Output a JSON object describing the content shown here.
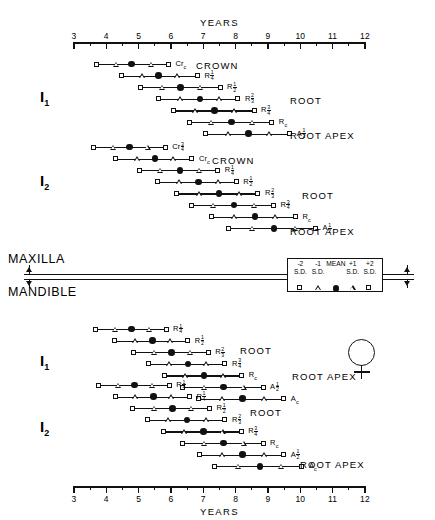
{
  "axis": {
    "title": "YEARS",
    "min": 3,
    "max": 12,
    "ticks": [
      3,
      4,
      5,
      6,
      7,
      8,
      9,
      10,
      11,
      12
    ],
    "tick_labels": [
      "3",
      "4",
      "5",
      "6",
      "7",
      "8",
      "9",
      "10",
      "11",
      "12"
    ],
    "minor_per_interval": 1
  },
  "jaw": {
    "upper": "MAXILLA",
    "lower": "MANDIBLE"
  },
  "sex_symbol": "female-symbol",
  "legend": {
    "labels": [
      {
        "top": "-2",
        "bottom": "S.D.",
        "x": 10.0,
        "symbol": "square"
      },
      {
        "top": "-1",
        "bottom": "S.D.",
        "x": 10.55,
        "symbol": "triangle"
      },
      {
        "top": "",
        "bottom": "MEAN",
        "x": 11.1,
        "symbol": "dot"
      },
      {
        "top": "+1",
        "bottom": "S.D.",
        "x": 11.62,
        "symbol": "triangle"
      },
      {
        "top": "+2",
        "bottom": "S.D.",
        "x": 12.15,
        "symbol": "square"
      }
    ]
  },
  "headings": {
    "crown": "CROWN",
    "root": "ROOT",
    "root_apex": "ROOT APEX"
  },
  "chart_data": {
    "type": "range-dot",
    "xlabel": "YEARS",
    "xlim": [
      3,
      12
    ],
    "grid": false,
    "legend_position": "center",
    "symbol_meaning": {
      "square": "±2 S.D.",
      "triangle": "±1 S.D.",
      "dot": "MEAN"
    },
    "sections": [
      {
        "jaw": "MAXILLA",
        "tooth": "I",
        "tooth_sub": "1",
        "rows": [
          {
            "stage": "Cr",
            "stage_sub": "c",
            "frac": null,
            "sd_minus2": 3.72,
            "sd_minus1": 4.32,
            "mean": 4.78,
            "sd_plus1": 5.38,
            "sd_plus2": 5.95
          },
          {
            "stage": "R",
            "frac": "1/4",
            "sd_minus2": 4.5,
            "sd_minus1": 5.1,
            "mean": 5.62,
            "sd_plus1": 6.2,
            "sd_plus2": 6.85
          },
          {
            "stage": "R",
            "frac": "1/2",
            "sd_minus2": 5.1,
            "sd_minus1": 5.72,
            "mean": 6.3,
            "sd_plus1": 6.9,
            "sd_plus2": 7.55
          },
          {
            "stage": "R",
            "frac": "2/3",
            "sd_minus2": 5.65,
            "sd_minus1": 6.28,
            "mean": 6.9,
            "sd_plus1": 7.5,
            "sd_plus2": 8.1
          },
          {
            "stage": "R",
            "frac": "3/4",
            "sd_minus2": 6.1,
            "sd_minus1": 6.75,
            "mean": 7.35,
            "sd_plus1": 7.95,
            "sd_plus2": 8.6
          },
          {
            "stage": "R",
            "stage_sub": "c",
            "frac": null,
            "sd_minus2": 6.6,
            "sd_minus1": 7.25,
            "mean": 7.88,
            "sd_plus1": 8.5,
            "sd_plus2": 9.15
          },
          {
            "stage": "A",
            "frac": "1/2",
            "sd_minus2": 7.1,
            "sd_minus1": 7.78,
            "mean": 8.4,
            "sd_plus1": 9.05,
            "sd_plus2": 9.7
          }
        ]
      },
      {
        "jaw": "MAXILLA",
        "tooth": "I",
        "tooth_sub": "2",
        "rows": [
          {
            "stage": "Cr",
            "frac": "3/4",
            "sd_minus2": 3.62,
            "sd_minus1": 4.2,
            "mean": 4.72,
            "sd_plus1": 5.28,
            "sd_plus2": 5.85
          },
          {
            "stage": "Cr",
            "stage_sub": "c",
            "frac": null,
            "sd_minus2": 4.32,
            "sd_minus1": 4.95,
            "mean": 5.5,
            "sd_plus1": 6.08,
            "sd_plus2": 6.68
          },
          {
            "stage": "R",
            "frac": "1/4",
            "sd_minus2": 5.05,
            "sd_minus1": 5.68,
            "mean": 6.28,
            "sd_plus1": 6.88,
            "sd_plus2": 7.48
          },
          {
            "stage": "R",
            "frac": "1/2",
            "sd_minus2": 5.6,
            "sd_minus1": 6.25,
            "mean": 6.85,
            "sd_plus1": 7.45,
            "sd_plus2": 8.05
          },
          {
            "stage": "R",
            "frac": "2/3",
            "sd_minus2": 6.2,
            "sd_minus1": 6.88,
            "mean": 7.48,
            "sd_plus1": 8.1,
            "sd_plus2": 8.72
          },
          {
            "stage": "R",
            "frac": "3/4",
            "sd_minus2": 6.65,
            "sd_minus1": 7.32,
            "mean": 7.95,
            "sd_plus1": 8.58,
            "sd_plus2": 9.2
          },
          {
            "stage": "R",
            "stage_sub": "c",
            "frac": null,
            "sd_minus2": 7.28,
            "sd_minus1": 7.95,
            "mean": 8.6,
            "sd_plus1": 9.22,
            "sd_plus2": 9.88
          },
          {
            "stage": "A",
            "frac": "1/2",
            "sd_minus2": 7.82,
            "sd_minus1": 8.52,
            "mean": 9.18,
            "sd_plus1": 9.85,
            "sd_plus2": 10.5
          }
        ]
      },
      {
        "jaw": "MANDIBLE",
        "tooth": "I",
        "tooth_sub": "1",
        "rows": [
          {
            "stage": "R",
            "frac": "1/4",
            "sd_minus2": 3.7,
            "sd_minus1": 4.28,
            "mean": 4.78,
            "sd_plus1": 5.32,
            "sd_plus2": 5.88
          },
          {
            "stage": "R",
            "frac": "1/2",
            "sd_minus2": 4.28,
            "sd_minus1": 4.88,
            "mean": 5.42,
            "sd_plus1": 5.98,
            "sd_plus2": 6.55
          },
          {
            "stage": "R",
            "frac": "2/3",
            "sd_minus2": 4.88,
            "sd_minus1": 5.48,
            "mean": 6.02,
            "sd_plus1": 6.6,
            "sd_plus2": 7.18
          },
          {
            "stage": "R",
            "frac": "3/4",
            "sd_minus2": 5.35,
            "sd_minus1": 5.95,
            "mean": 6.52,
            "sd_plus1": 7.1,
            "sd_plus2": 7.7
          },
          {
            "stage": "R",
            "stage_sub": "c",
            "frac": null,
            "sd_minus2": 5.82,
            "sd_minus1": 6.45,
            "mean": 7.02,
            "sd_plus1": 7.62,
            "sd_plus2": 8.22
          },
          {
            "stage": "A",
            "frac": "1/2",
            "sd_minus2": 6.4,
            "sd_minus1": 7.02,
            "mean": 7.62,
            "sd_plus1": 8.25,
            "sd_plus2": 8.88
          },
          {
            "stage": "A",
            "stage_sub": "c",
            "frac": null,
            "sd_minus2": 6.88,
            "sd_minus1": 7.58,
            "mean": 8.22,
            "sd_plus1": 8.88,
            "sd_plus2": 9.52
          }
        ]
      },
      {
        "jaw": "MANDIBLE",
        "tooth": "I",
        "tooth_sub": "2",
        "rows": [
          {
            "stage": "R",
            "frac": "1/4",
            "sd_minus2": 3.8,
            "sd_minus1": 4.38,
            "mean": 4.88,
            "sd_plus1": 5.42,
            "sd_plus2": 5.98
          },
          {
            "stage": "R",
            "frac": "1/4",
            "sd_minus2": 4.3,
            "sd_minus1": 4.9,
            "mean": 5.45,
            "sd_plus1": 6.02,
            "sd_plus2": 6.6
          },
          {
            "stage": "R",
            "frac": "1/2",
            "sd_minus2": 4.85,
            "sd_minus1": 5.48,
            "mean": 6.05,
            "sd_plus1": 6.62,
            "sd_plus2": 7.22
          },
          {
            "stage": "R",
            "frac": "2/3",
            "sd_minus2": 5.3,
            "sd_minus1": 5.92,
            "mean": 6.5,
            "sd_plus1": 7.1,
            "sd_plus2": 7.7
          },
          {
            "stage": "R",
            "frac": "3/4",
            "sd_minus2": 5.8,
            "sd_minus1": 6.42,
            "mean": 7.0,
            "sd_plus1": 7.6,
            "sd_plus2": 8.2
          },
          {
            "stage": "R",
            "stage_sub": "c",
            "frac": null,
            "sd_minus2": 6.38,
            "sd_minus1": 7.02,
            "mean": 7.62,
            "sd_plus1": 8.25,
            "sd_plus2": 8.88
          },
          {
            "stage": "A",
            "frac": "1/2",
            "sd_minus2": 6.9,
            "sd_minus1": 7.58,
            "mean": 8.22,
            "sd_plus1": 8.88,
            "sd_plus2": 9.52
          },
          {
            "stage": "A",
            "stage_sub": "c",
            "frac": null,
            "sd_minus2": 7.38,
            "sd_minus1": 8.08,
            "mean": 8.75,
            "sd_plus1": 9.42,
            "sd_plus2": 10.08
          }
        ]
      }
    ]
  },
  "layout": {
    "axis_x0_px": 74,
    "axis_x1_px": 365,
    "top_axis_y": 42,
    "bottom_axis_y": 486,
    "section_tops": [
      60,
      143,
      325,
      381
    ],
    "row_height": 11.6,
    "tooth_label_x": 40,
    "tooth_label_ys": [
      88,
      172,
      352,
      418
    ],
    "stage_heads": [
      {
        "text": "CROWN",
        "x": 196,
        "y": 60
      },
      {
        "text": "ROOT",
        "x": 290,
        "y": 95
      },
      {
        "text": "ROOT APEX",
        "x": 290,
        "y": 130
      },
      {
        "text": "CROWN",
        "x": 212,
        "y": 155
      },
      {
        "text": "ROOT",
        "x": 302,
        "y": 190
      },
      {
        "text": "ROOT APEX",
        "x": 290,
        "y": 226
      },
      {
        "text": "ROOT",
        "x": 240,
        "y": 345
      },
      {
        "text": "ROOT APEX",
        "x": 292,
        "y": 371
      },
      {
        "text": "ROOT",
        "x": 250,
        "y": 407
      },
      {
        "text": "ROOT APEX",
        "x": 300,
        "y": 459
      }
    ]
  }
}
